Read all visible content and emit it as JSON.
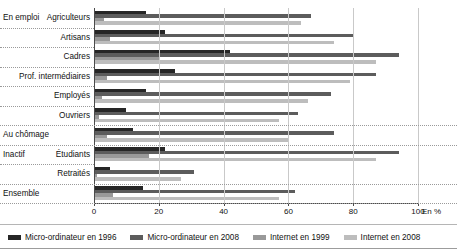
{
  "chart_data": {
    "type": "bar",
    "orientation": "horizontal",
    "title": "",
    "xlabel": "En %",
    "ylabel": "",
    "xlim": [
      0,
      100
    ],
    "xticks": [
      0,
      20,
      40,
      60,
      80,
      100
    ],
    "grid": true,
    "legend_position": "bottom",
    "unit_label": "En %",
    "sections": [
      {
        "name": "En emploi",
        "categories": [
          "Agriculteurs",
          "Artisans",
          "Cadres",
          "Prof. intermédiaires",
          "Employés",
          "Ouvriers"
        ]
      },
      {
        "name": "Au chômage",
        "categories": [
          ""
        ]
      },
      {
        "name": "Inactif",
        "categories": [
          "Étudiants",
          "Retraités"
        ]
      },
      {
        "name": "Ensemble",
        "categories": [
          ""
        ]
      }
    ],
    "categories": [
      "Agriculteurs",
      "Artisans",
      "Cadres",
      "Prof. intermédiaires",
      "Employés",
      "Ouvriers",
      "Au chômage",
      "Étudiants",
      "Retraités",
      "Ensemble"
    ],
    "series": [
      {
        "name": "Micro-ordinateur en 1996",
        "color": "#262626",
        "values": [
          16,
          22,
          42,
          25,
          16,
          10,
          12,
          22,
          5,
          15
        ]
      },
      {
        "name": "Micro-ordinateur en 2008",
        "color": "#5c5c5c",
        "values": [
          67,
          80,
          94,
          87,
          73,
          63,
          74,
          94,
          31,
          62
        ]
      },
      {
        "name": "Internet en 1999",
        "color": "#999999",
        "values": [
          3,
          5,
          20,
          4,
          2.5,
          1.5,
          4,
          17,
          1,
          6
        ]
      },
      {
        "name": "Internet en 2008",
        "color": "#bdbdbd",
        "values": [
          64,
          74,
          87,
          79,
          66,
          57,
          60,
          87,
          27,
          57
        ]
      }
    ]
  },
  "axis": {
    "tick_labels": [
      "0",
      "20",
      "40",
      "60",
      "80",
      "100"
    ],
    "unit": "En %"
  },
  "legend": {
    "items": [
      {
        "label": "Micro-ordinateur en 1996",
        "color": "#262626"
      },
      {
        "label": "Micro-ordinateur en 2008",
        "color": "#5c5c5c"
      },
      {
        "label": "Internet en 1999",
        "color": "#999999"
      },
      {
        "label": "Internet en 2008",
        "color": "#bdbdbd"
      }
    ]
  }
}
